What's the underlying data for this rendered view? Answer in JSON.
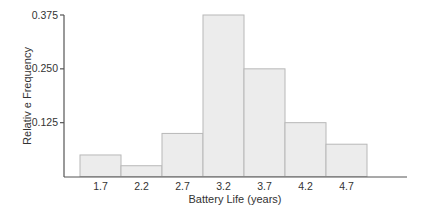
{
  "chart_data": {
    "type": "bar",
    "title": "",
    "xlabel": "Battery Life (years)",
    "ylabel": "Relativ e Frequency",
    "categories": [
      "1.7",
      "2.2",
      "2.7",
      "3.2",
      "3.7",
      "4.2",
      "4.7"
    ],
    "values": [
      0.05,
      0.025,
      0.1,
      0.375,
      0.25,
      0.125,
      0.075
    ],
    "ylim": [
      0,
      0.375
    ],
    "yticks": [
      "0.125",
      "0.250",
      "0.375"
    ],
    "ytick_values": [
      0.125,
      0.25,
      0.375
    ],
    "grid": false,
    "legend": null,
    "histogram": true
  },
  "colors": {
    "bar_fill": "#ececec",
    "bar_stroke": "#b8b8b8",
    "axis": "#555555",
    "text": "#333333"
  }
}
